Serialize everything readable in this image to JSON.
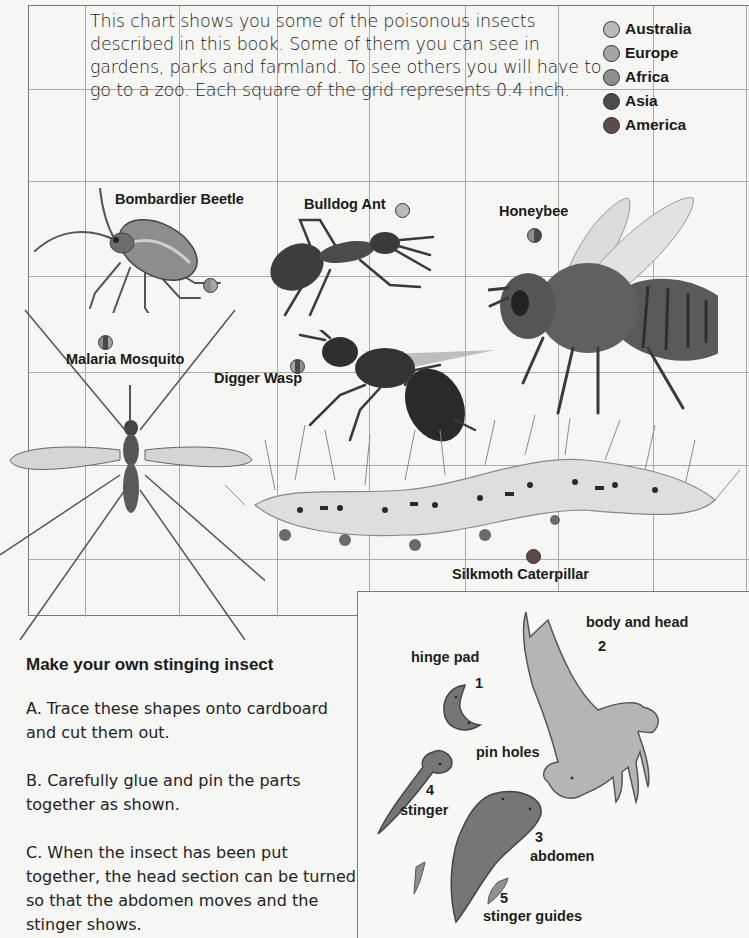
{
  "intro": {
    "text": "This chart shows you some of the poisonous insects described in this book. Some of them you can see in gardens, parks and farmland. To see others you will have to go to a zoo. Each square of the grid represents 0.4 inch.",
    "grid_square_size": "0.4 inch"
  },
  "legend": {
    "items": [
      {
        "label": "Australia",
        "color": "#b9b9b7"
      },
      {
        "label": "Europe",
        "color": "#a5a5a3"
      },
      {
        "label": "Africa",
        "color": "#8e8e8c"
      },
      {
        "label": "Asia",
        "color": "#4a4a48"
      },
      {
        "label": "America",
        "color": "#5e4a4a"
      }
    ]
  },
  "insects": [
    {
      "name": "Bombardier Beetle",
      "regions": [
        "Africa",
        "Europe"
      ]
    },
    {
      "name": "Bulldog Ant",
      "regions": [
        "Australia"
      ]
    },
    {
      "name": "Honeybee",
      "regions": [
        "Africa",
        "Asia"
      ]
    },
    {
      "name": "Malaria Mosquito",
      "regions": [
        "Africa",
        "Asia",
        "Europe"
      ]
    },
    {
      "name": "Digger Wasp",
      "regions": [
        "Europe",
        "Asia",
        "Africa"
      ]
    },
    {
      "name": "Silkmoth Caterpillar",
      "regions": [
        "America"
      ]
    }
  ],
  "howto": {
    "title": "Make your own stinging insect",
    "steps": [
      "A. Trace these shapes onto cardboard and cut them out.",
      "B. Carefully glue and pin the parts together as shown.",
      "C. When the insect has been put together, the head section can be turned so that the abdomen moves and the stinger shows."
    ]
  },
  "parts": {
    "hinge_pad": {
      "label": "hinge pad",
      "number": "1"
    },
    "body_and_head": {
      "label": "body and head",
      "number": "2"
    },
    "abdomen": {
      "label": "abdomen",
      "number": "3"
    },
    "stinger": {
      "label": "stinger",
      "number": "4"
    },
    "stinger_guides": {
      "label": "stinger guides",
      "number": "5"
    },
    "pin_holes": {
      "label": "pin holes"
    }
  }
}
